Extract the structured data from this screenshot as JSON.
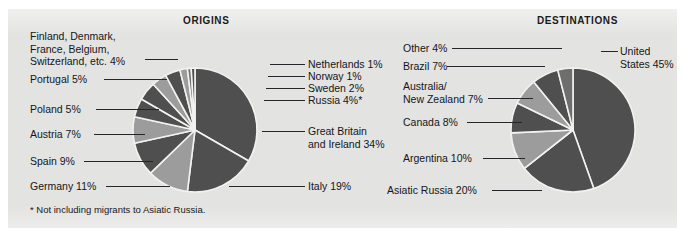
{
  "panel": {
    "background_color": "#e3e3e1",
    "page_background_color": "#ffffff"
  },
  "colors": {
    "dark_slice": "#4f4f4f",
    "light_slice": "#9c9c9c",
    "mid_slice": "#6e6e6e",
    "slice_divider": "#f2f2f0",
    "text": "#14161a",
    "leader_line": "#24262a"
  },
  "origins": {
    "title": "ORIGINS",
    "footnote": "* Not including migrants to Asiatic Russia.",
    "labels": {
      "group_multi": "Finland, Denmark,\nFrance, Belgium,\nSwitzerland, etc.  4%",
      "group_multi_line1": "Finland, Denmark,",
      "group_multi_line2": "France, Belgium,",
      "group_multi_line3": "Switzerland, etc.  4%",
      "portugal": "Portugal  5%",
      "poland": "Poland  5%",
      "austria": "Austria  7%",
      "spain": "Spain  9%",
      "germany": "Germany  11%",
      "netherlands": "Netherlands 1%",
      "norway": "Norway 1%",
      "sweden": "Sweden 2%",
      "russia": "Russia 4%*",
      "great_britain_line1": "Great Britain",
      "great_britain_line2": "and Ireland  34%",
      "italy": "Italy  19%"
    }
  },
  "destinations": {
    "title": "DESTINATIONS",
    "labels": {
      "other": "Other  4%",
      "brazil": "Brazil  7%",
      "australia_nz_line1": "Australia/",
      "australia_nz_line2": "New Zealand  7%",
      "canada": "Canada  8%",
      "argentina": "Argentina  10%",
      "asiatic_russia": "Asiatic Russia  20%",
      "united_states_line1": "United",
      "united_states_line2": "States 45%"
    }
  },
  "chart_data": [
    {
      "type": "pie",
      "title": "ORIGINS",
      "unit": "percent",
      "total": 100,
      "footnote": "* Not including migrants to Asiatic Russia.",
      "categories": [
        "Great Britain and Ireland",
        "Italy",
        "Germany",
        "Spain",
        "Austria",
        "Poland",
        "Portugal",
        "Finland, Denmark, France, Belgium, Switzerland, etc.",
        "Russia",
        "Sweden",
        "Norway",
        "Netherlands"
      ],
      "values": [
        34,
        19,
        11,
        9,
        7,
        5,
        5,
        4,
        4,
        2,
        1,
        1
      ],
      "labels": [
        "Great Britain and Ireland  34%",
        "Italy  19%",
        "Germany  11%",
        "Spain  9%",
        "Austria  7%",
        "Poland  5%",
        "Portugal  5%",
        "Finland, Denmark, France, Belgium, Switzerland, etc.  4%",
        "Russia 4%*",
        "Sweden 2%",
        "Norway 1%",
        "Netherlands 1%"
      ],
      "slice_colors": [
        "#4f4f4f",
        "#4f4f4f",
        "#9c9c9c",
        "#4f4f4f",
        "#9c9c9c",
        "#4f4f4f",
        "#4f4f4f",
        "#9c9c9c",
        "#4f4f4f",
        "#9c9c9c",
        "#6e6e6e",
        "#4f4f4f"
      ],
      "legend": "none",
      "grid": false,
      "start_angle_deg": -90,
      "direction": "clockwise"
    },
    {
      "type": "pie",
      "title": "DESTINATIONS",
      "unit": "percent",
      "total": 101,
      "categories": [
        "United States",
        "Asiatic Russia",
        "Argentina",
        "Canada",
        "Australia/New Zealand",
        "Brazil",
        "Other"
      ],
      "values": [
        45,
        20,
        10,
        8,
        7,
        7,
        4
      ],
      "labels": [
        "United States 45%",
        "Asiatic Russia  20%",
        "Argentina  10%",
        "Canada  8%",
        "Australia/New Zealand  7%",
        "Brazil  7%",
        "Other  4%"
      ],
      "slice_colors": [
        "#4f4f4f",
        "#4f4f4f",
        "#9c9c9c",
        "#4f4f4f",
        "#9c9c9c",
        "#4f4f4f",
        "#6e6e6e"
      ],
      "legend": "none",
      "grid": false,
      "start_angle_deg": -90,
      "direction": "clockwise"
    }
  ]
}
